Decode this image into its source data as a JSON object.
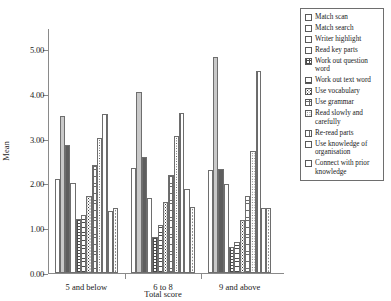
{
  "chart_data": {
    "type": "bar",
    "title": "",
    "xlabel": "Total score",
    "ylabel": "Mean",
    "ylim": [
      0,
      5.0
    ],
    "ytick_labels": [
      "0.00",
      "1.00",
      "2.00",
      "3.00",
      "4.00",
      "5.00"
    ],
    "ytick_values": [
      0,
      1,
      2,
      3,
      4,
      5
    ],
    "grid": false,
    "legend_position": "right",
    "categories": [
      "5 and below",
      "6 to 8",
      "9 and above"
    ],
    "series": [
      {
        "name": "Match scan",
        "values": [
          2.1,
          2.35,
          2.3
        ]
      },
      {
        "name": "Match search",
        "values": [
          3.5,
          4.05,
          4.83
        ]
      },
      {
        "name": "Writer highlight",
        "values": [
          2.85,
          2.58,
          2.32
        ]
      },
      {
        "name": "Read key parts",
        "values": [
          2.02,
          1.68,
          1.98
        ]
      },
      {
        "name": "Work out question word",
        "values": [
          1.2,
          0.8,
          0.58
        ]
      },
      {
        "name": "Work out text word",
        "values": [
          1.3,
          1.08,
          0.7
        ]
      },
      {
        "name": "Use vocabulary",
        "values": [
          1.72,
          1.58,
          1.18
        ]
      },
      {
        "name": "Use grammar",
        "values": [
          2.4,
          2.18,
          1.72
        ]
      },
      {
        "name": "Read slowly and carefully",
        "values": [
          3.02,
          3.05,
          2.72
        ]
      },
      {
        "name": "Re-read parts",
        "values": [
          3.55,
          3.58,
          4.5
        ]
      },
      {
        "name": "Use knowledge of organisation",
        "values": [
          1.38,
          1.88,
          1.45
        ]
      },
      {
        "name": "Connect with prior knowledge",
        "values": [
          1.45,
          1.48,
          1.45
        ]
      }
    ]
  },
  "legend": {
    "items": [
      {
        "label": "Match scan"
      },
      {
        "label": "Match search"
      },
      {
        "label": "Writer highlight"
      },
      {
        "label": "Read key parts"
      },
      {
        "label": "Work out question word"
      },
      {
        "label": "Work out text word"
      },
      {
        "label": "Use vocabulary"
      },
      {
        "label": "Use grammar"
      },
      {
        "label": "Read slowly and carefully"
      },
      {
        "label": "Re-read parts"
      },
      {
        "label": "Use knowledge of organisation"
      },
      {
        "label": "Connect with prior knowledge"
      }
    ]
  },
  "colors": {
    "axis": "#8a8a8a",
    "bar_outline": "#6e6e6e",
    "text": "#1a1a1a"
  }
}
